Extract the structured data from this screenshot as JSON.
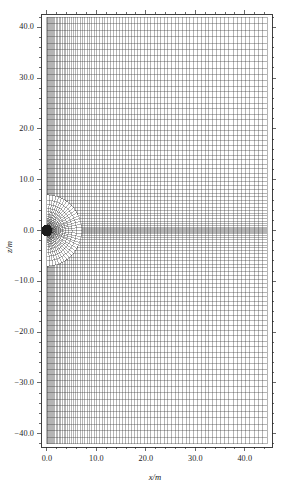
{
  "figure": {
    "kind": "computational-mesh-plot",
    "background_color": "#ffffff",
    "line_color": "#161616",
    "frame_color": "#2a2a2a"
  },
  "chart_data": {
    "type": "scatter",
    "title": "",
    "subtitle": "",
    "xlabel": "x/m",
    "ylabel": "z/m",
    "xlim": [
      -1.2,
      45.5
    ],
    "ylim": [
      -42.6,
      42.6
    ],
    "xticks": [
      0.0,
      10.0,
      20.0,
      30.0,
      40.0
    ],
    "xtick_labels": [
      "0.0",
      "10.0",
      "20.0",
      "30.0",
      "40.0"
    ],
    "yticks": [
      40.0,
      30.0,
      20.0,
      10.0,
      0.0,
      -10.0,
      -20.0,
      -30.0,
      -40.0
    ],
    "ytick_labels": [
      "40.0",
      "30.0",
      "20.0",
      "10.0",
      "0.0",
      "-10.0",
      "-20.0",
      "-30.0",
      "-40.0"
    ],
    "minor_ticks_per_interval": 5,
    "grid": false,
    "tick_direction": "out",
    "frame": "full-box",
    "legend": null,
    "annotations": [],
    "mesh": {
      "description": "Structured mesh of a half-space domain with a radially refined polar sub-mesh centred on the origin",
      "domain_x_range": [
        0.0,
        44.5
      ],
      "domain_z_range": [
        -42.0,
        42.0
      ],
      "polar_region": {
        "center_x": 0.0,
        "center_z": 0.0,
        "inner_radius": 0.35,
        "outer_radius": 7.0,
        "radial_divisions": 22,
        "angular_divisions": 36,
        "angular_span_deg": 180,
        "angular_start_deg": -90,
        "radial_growth": 1.18
      },
      "cartesian_region": {
        "x_divisions": 78,
        "z_divisions": 96,
        "x_grading": "fine near x=0, coarsening toward x=44.5",
        "z_grading": "fine near z=0, coarsening toward |z|=42"
      }
    }
  }
}
